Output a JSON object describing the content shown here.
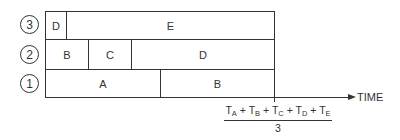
{
  "diagram": {
    "type": "timeline-schedule",
    "rows": [
      {
        "id": 3,
        "label": "3",
        "segments": [
          {
            "label": "D",
            "x0": 45,
            "x1": 66
          },
          {
            "label": "E",
            "x0": 66,
            "x1": 274
          }
        ]
      },
      {
        "id": 2,
        "label": "2",
        "segments": [
          {
            "label": "B",
            "x0": 45,
            "x1": 88
          },
          {
            "label": "C",
            "x0": 88,
            "x1": 131
          },
          {
            "label": "D",
            "x0": 131,
            "x1": 274
          }
        ]
      },
      {
        "id": 1,
        "label": "1",
        "segments": [
          {
            "label": "A",
            "x0": 45,
            "x1": 160
          },
          {
            "label": "B",
            "x0": 160,
            "x1": 274
          }
        ]
      }
    ],
    "axis_label": "TIME",
    "formula": {
      "terms": [
        {
          "base": "T",
          "sub": "A"
        },
        {
          "base": "T",
          "sub": "B"
        },
        {
          "base": "T",
          "sub": "C"
        },
        {
          "base": "T",
          "sub": "D"
        },
        {
          "base": "T",
          "sub": "E"
        }
      ],
      "operator": "+",
      "denominator": "3"
    }
  }
}
